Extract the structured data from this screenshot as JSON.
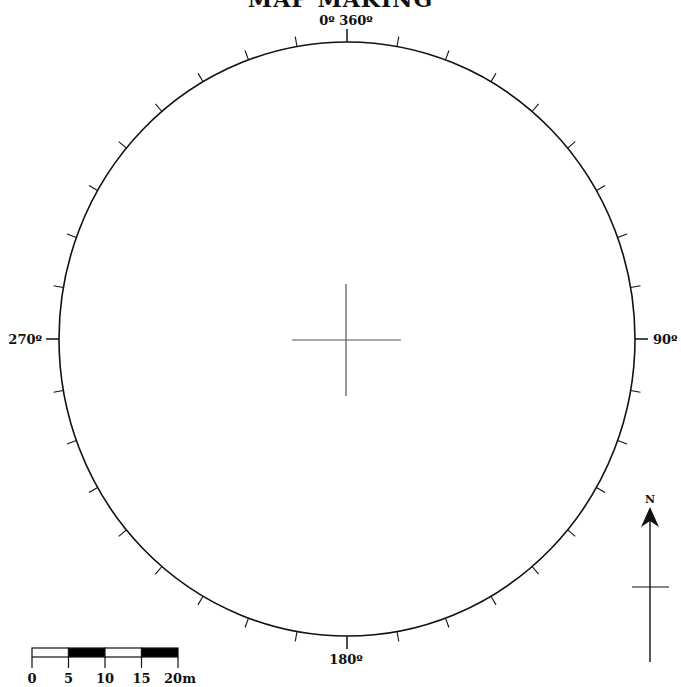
{
  "title": "MAP MAKING",
  "compass": {
    "center": [
      347,
      339
    ],
    "rx": 288,
    "ry": 297,
    "tick_interval_deg": 10,
    "labels": {
      "north": "0º 360º",
      "east": "90º",
      "south": "180º",
      "west": "270º"
    }
  },
  "crosshair": {
    "vertical": [
      346,
      284,
      346,
      396
    ],
    "horizontal": [
      292,
      340,
      401,
      340
    ]
  },
  "north_arrow": {
    "label": "N"
  },
  "scale_bar": {
    "unit": "m",
    "labels": [
      "0",
      "5",
      "10",
      "15",
      "20m"
    ],
    "segment_fills": [
      "#ffffff",
      "#000000",
      "#ffffff",
      "#000000"
    ]
  },
  "colors": {
    "line": "#111111",
    "crosshair": "#555555",
    "background": "#ffffff"
  }
}
